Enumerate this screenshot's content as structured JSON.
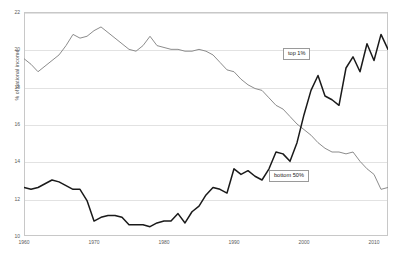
{
  "chart_data": {
    "type": "line",
    "title": "",
    "xlabel": "",
    "ylabel": "% of national income",
    "xlim": [
      1962,
      2014
    ],
    "ylim": [
      10,
      22
    ],
    "grid": true,
    "legend_position": "inline-annotations",
    "x_ticks": [
      "1960",
      "1970",
      "1980",
      "1990",
      "2000",
      "2010"
    ],
    "x_tick_values": [
      1960,
      1970,
      1980,
      1990,
      2000,
      2010
    ],
    "y_ticks": [
      "10",
      "12",
      "14",
      "16",
      "18",
      "20",
      "22"
    ],
    "y_tick_values": [
      10,
      12,
      14,
      16,
      18,
      20,
      22
    ],
    "x": [
      1962,
      1963,
      1964,
      1965,
      1966,
      1967,
      1968,
      1969,
      1970,
      1971,
      1972,
      1973,
      1974,
      1975,
      1976,
      1977,
      1978,
      1979,
      1980,
      1981,
      1982,
      1983,
      1984,
      1985,
      1986,
      1987,
      1988,
      1989,
      1990,
      1991,
      1992,
      1993,
      1994,
      1995,
      1996,
      1997,
      1998,
      1999,
      2000,
      2001,
      2002,
      2003,
      2004,
      2005,
      2006,
      2007,
      2008,
      2009,
      2010,
      2011,
      2012,
      2013,
      2014
    ],
    "series": [
      {
        "name": "bottom 50%",
        "color": "#8c8c8c",
        "values": [
          19.5,
          19.2,
          18.8,
          19.1,
          19.4,
          19.7,
          20.2,
          20.8,
          20.6,
          20.7,
          21.0,
          21.2,
          20.9,
          20.6,
          20.3,
          20.0,
          19.9,
          20.2,
          20.7,
          20.2,
          20.1,
          20.0,
          20.0,
          19.9,
          19.9,
          20.0,
          19.9,
          19.7,
          19.3,
          18.9,
          18.8,
          18.4,
          18.1,
          17.9,
          17.8,
          17.4,
          17.0,
          16.8,
          16.4,
          16.0,
          15.7,
          15.4,
          15.0,
          14.7,
          14.5,
          14.5,
          14.4,
          14.5,
          14.0,
          13.6,
          13.3,
          12.5,
          12.6
        ]
      },
      {
        "name": "top 1%",
        "color": "#1a1a1a",
        "values": [
          12.6,
          12.5,
          12.6,
          12.8,
          13.0,
          12.9,
          12.7,
          12.5,
          12.5,
          11.9,
          10.8,
          11.0,
          11.1,
          11.1,
          11.0,
          10.6,
          10.6,
          10.6,
          10.5,
          10.7,
          10.8,
          10.8,
          11.2,
          10.7,
          11.3,
          11.6,
          12.2,
          12.6,
          12.5,
          12.3,
          13.6,
          13.3,
          13.5,
          13.2,
          13.0,
          13.6,
          14.5,
          14.4,
          14.0,
          15.0,
          16.5,
          17.8,
          18.6,
          17.5,
          17.3,
          17.0,
          19.0,
          19.6,
          18.8,
          20.3,
          19.4,
          20.8,
          20.0
        ]
      }
    ],
    "annotations": [
      {
        "name": "top-1-percent-label",
        "text": "top 1%",
        "x_px": 283,
        "y_px": 48
      },
      {
        "name": "bottom-50-percent-label",
        "text": "bottom 50%",
        "x_px": 269,
        "y_px": 170
      }
    ]
  }
}
